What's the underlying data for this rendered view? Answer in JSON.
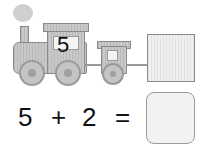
{
  "train": {
    "engine_number": "5"
  },
  "equation": {
    "a": "5",
    "op": "+",
    "b": "2",
    "eq": "=",
    "answer": ""
  },
  "colors": {
    "wood": "#c4c4c4",
    "outline": "#8a8a8a",
    "answer_box": "#f2f2f2"
  }
}
